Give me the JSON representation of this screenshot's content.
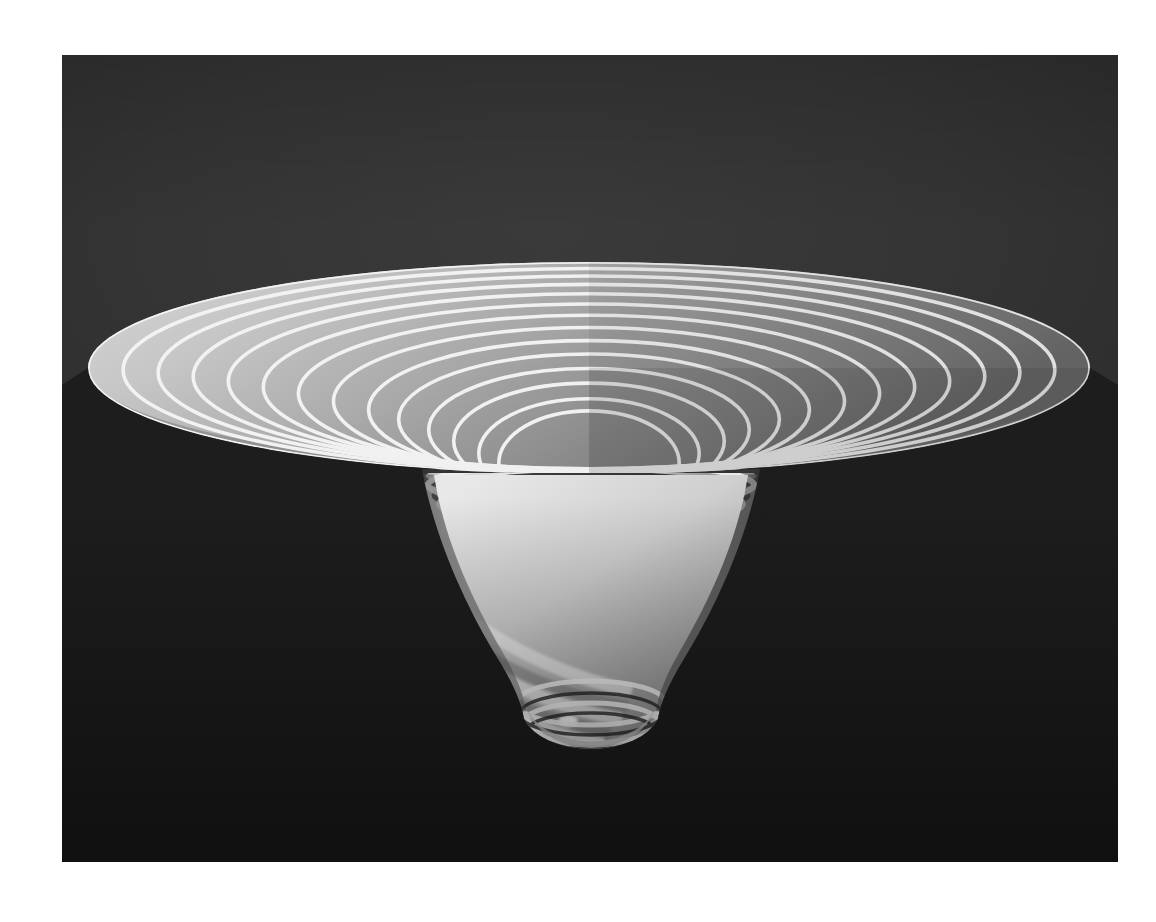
{
  "figure": {
    "title": "",
    "kind": "3d-surface-plot",
    "colormap": "grayscale",
    "panel": {
      "x": 62,
      "y": 55,
      "width": 1056,
      "height": 807,
      "background_top_color": "#3a3a3a",
      "background_mid_color": "#2c2c2c",
      "background_bottom_color": "#141414",
      "page_margin_color": "#ffffff"
    },
    "surface": {
      "line_color": "#f2f2f2",
      "fill_light_color": "#c9c9c9",
      "fill_mid_color": "#9a9a9a",
      "fill_dark_color": "#5e5e5e",
      "shadow_color": "#1c1c1c",
      "light_direction": "upper-left"
    }
  },
  "chart_data": {
    "type": "surface",
    "title": "",
    "xlabel": "",
    "ylabel": "",
    "zlabel": "",
    "grid": false,
    "legend": false,
    "projection": "3d perspective, elevation ~22 deg, azimuth ~0 deg",
    "rim": {
      "center_x_px": 589,
      "center_y_px": 368,
      "semi_major_px": 501,
      "semi_minor_px": 106
    },
    "throat": {
      "center_x_px": 592,
      "center_y_px": 476,
      "semi_major_px": 160,
      "semi_minor_px": 26
    },
    "tip": {
      "center_x_px": 594,
      "bottom_y_px": 719,
      "half_width_px": 67
    },
    "ring_count_rim": 14,
    "ring_count_wall": 12,
    "radii_normalized": [
      1.0,
      0.93,
      0.86,
      0.79,
      0.72,
      0.65,
      0.58,
      0.51,
      0.44,
      0.38,
      0.32,
      0.27,
      0.22,
      0.18
    ],
    "z_levels_normalized": [
      0.0,
      -0.02,
      -0.05,
      -0.09,
      -0.14,
      -0.2,
      -0.27,
      -0.35,
      -0.44,
      -0.54,
      -0.65,
      -0.77,
      -0.9,
      -1.0
    ],
    "axis_ranges": {
      "x": [
        -1,
        1
      ],
      "y": [
        -1,
        1
      ],
      "z": [
        -1,
        0
      ]
    }
  },
  "annotations": {
    "caption": "",
    "labels": []
  }
}
